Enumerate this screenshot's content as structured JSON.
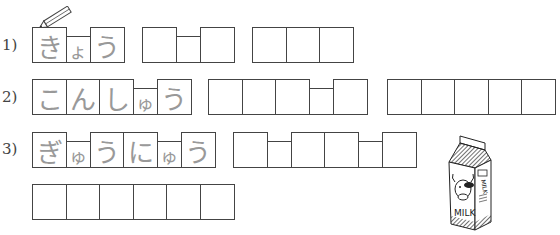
{
  "questions": [
    {
      "number": "1)",
      "groups": [
        {
          "cells": [
            {
              "size": "big",
              "char": "き"
            },
            {
              "size": "small",
              "char": "ょ"
            },
            {
              "size": "big",
              "char": "う"
            }
          ]
        },
        {
          "cells": [
            {
              "size": "big",
              "char": ""
            },
            {
              "size": "small",
              "char": ""
            },
            {
              "size": "big",
              "char": ""
            }
          ]
        },
        {
          "cells": [
            {
              "size": "big",
              "char": ""
            },
            {
              "size": "big",
              "char": ""
            },
            {
              "size": "big",
              "char": ""
            }
          ]
        }
      ]
    },
    {
      "number": "2)",
      "groups": [
        {
          "cells": [
            {
              "size": "big",
              "char": "こ"
            },
            {
              "size": "big",
              "char": "ん"
            },
            {
              "size": "big",
              "char": "し"
            },
            {
              "size": "small",
              "char": "ゅ"
            },
            {
              "size": "big",
              "char": "う"
            }
          ]
        },
        {
          "cells": [
            {
              "size": "big",
              "char": ""
            },
            {
              "size": "big",
              "char": ""
            },
            {
              "size": "big",
              "char": ""
            },
            {
              "size": "small",
              "char": ""
            },
            {
              "size": "big",
              "char": ""
            }
          ]
        },
        {
          "cells": [
            {
              "size": "big",
              "char": ""
            },
            {
              "size": "big",
              "char": ""
            },
            {
              "size": "big",
              "char": ""
            },
            {
              "size": "big",
              "char": ""
            },
            {
              "size": "big",
              "char": ""
            }
          ]
        }
      ]
    },
    {
      "number": "3)",
      "groups": [
        {
          "cells": [
            {
              "size": "big",
              "char": "ぎ"
            },
            {
              "size": "small",
              "char": "ゅ"
            },
            {
              "size": "big",
              "char": "う"
            },
            {
              "size": "big",
              "char": "に"
            },
            {
              "size": "small",
              "char": "ゅ"
            },
            {
              "size": "big",
              "char": "う"
            }
          ]
        },
        {
          "cells": [
            {
              "size": "big",
              "char": ""
            },
            {
              "size": "small",
              "char": ""
            },
            {
              "size": "big",
              "char": ""
            },
            {
              "size": "big",
              "char": ""
            },
            {
              "size": "small",
              "char": ""
            },
            {
              "size": "big",
              "char": ""
            }
          ]
        },
        {
          "cells": [
            {
              "size": "big",
              "char": ""
            },
            {
              "size": "big",
              "char": ""
            },
            {
              "size": "big",
              "char": ""
            },
            {
              "size": "big",
              "char": ""
            },
            {
              "size": "big",
              "char": ""
            },
            {
              "size": "big",
              "char": ""
            }
          ]
        }
      ]
    }
  ],
  "illustration": {
    "carton_text_front": "MILK",
    "carton_text_side": "MILK"
  },
  "colors": {
    "border": "#444444",
    "trace_text": "#999999"
  }
}
